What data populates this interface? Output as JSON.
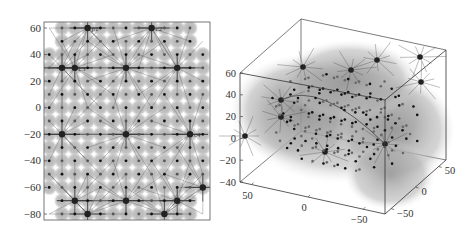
{
  "chart_data": [
    {
      "type": "scatter",
      "title": "",
      "panel": "left-2d-projection",
      "xlabel": "",
      "ylabel": "",
      "ylim": [
        -80,
        60
      ],
      "yticks": [
        60,
        40,
        20,
        0,
        -20,
        -40,
        -60,
        -80
      ],
      "grid": false,
      "description": "2D lattice of sensor nodes (gray coverage discs with black dots) with cluster heads connected to member nodes by lines",
      "lattice_spacing": 10,
      "x_range": [
        -60,
        60
      ],
      "cluster_heads": [
        {
          "label": "p1",
          "x": -30,
          "y": 60
        },
        {
          "label": "c2",
          "x": 20,
          "y": 60
        },
        {
          "label": "c3",
          "x": -40,
          "y": 30
        },
        {
          "label": "",
          "x": -50,
          "y": 30
        },
        {
          "label": "",
          "x": 0,
          "y": 30
        },
        {
          "label": "",
          "x": 40,
          "y": 30
        },
        {
          "label": "",
          "x": -50,
          "y": -20
        },
        {
          "label": "",
          "x": 0,
          "y": -20
        },
        {
          "label": "c4",
          "x": 50,
          "y": -20
        },
        {
          "label": "",
          "x": -40,
          "y": -70
        },
        {
          "label": "",
          "x": 0,
          "y": -70
        },
        {
          "label": "",
          "x": 40,
          "y": -70
        },
        {
          "label": "",
          "x": -30,
          "y": -80
        },
        {
          "label": "",
          "x": 30,
          "y": -80
        },
        {
          "label": "",
          "x": 60,
          "y": -60
        }
      ]
    },
    {
      "type": "scatter",
      "title": "",
      "panel": "right-3d-view",
      "zlim": [
        -40,
        60
      ],
      "zticks": [
        60,
        40,
        20,
        0,
        -20,
        -40
      ],
      "xticks": [
        50,
        0,
        -50
      ],
      "yticks": [
        50,
        0,
        -50
      ],
      "description": "3D lattice of sensor nodes inside a shaded volume with cluster heads connected to member nodes"
    }
  ],
  "left": {
    "yticks": [
      "60",
      "40",
      "20",
      "0",
      "−20",
      "−40",
      "−60",
      "−80"
    ]
  },
  "right": {
    "zticks": [
      "60",
      "40",
      "20",
      "0",
      "−20",
      "−40"
    ],
    "xticks": [
      "50",
      "0",
      "−50"
    ],
    "yticks": [
      "50",
      "0",
      "−50"
    ]
  }
}
